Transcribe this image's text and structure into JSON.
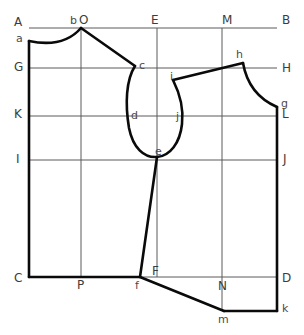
{
  "diagram": {
    "type": "sewing-pattern-construction-draft",
    "canvas": {
      "width": 304,
      "height": 335,
      "background": "#ffffff"
    },
    "colors": {
      "outline": "#0a0a0a",
      "construction": "#5a5a5a",
      "label": "#444444",
      "background": "#ffffff"
    },
    "frame": {
      "left": 29,
      "right": 277,
      "top": 28,
      "bottom": 277,
      "corner_labels": [
        "A",
        "B",
        "C",
        "D"
      ]
    },
    "horizontal_guides": [
      {
        "name": "A-B",
        "y": 28,
        "left_label": "A",
        "right_label": "B"
      },
      {
        "name": "G-H",
        "y": 68,
        "left_label": "G",
        "right_label": "H"
      },
      {
        "name": "K-L",
        "y": 116,
        "left_label": "K",
        "right_label": "L"
      },
      {
        "name": "I-J",
        "y": 160,
        "left_label": "I",
        "right_label": "J"
      },
      {
        "name": "C-D",
        "y": 277,
        "left_label": "C",
        "right_label": "D"
      }
    ],
    "vertical_guides": [
      {
        "name": "A-C",
        "x": 29,
        "top_label": "A",
        "bottom_label": "C"
      },
      {
        "name": "O-P",
        "x": 81,
        "top_label": "O",
        "bottom_label": "P"
      },
      {
        "name": "E-F",
        "x": 157,
        "top_label": "E",
        "bottom_label": "F"
      },
      {
        "name": "M-N",
        "x": 222,
        "top_label": "M",
        "bottom_label": "N"
      },
      {
        "name": "B-D",
        "x": 277,
        "top_label": "B",
        "bottom_label": "D"
      }
    ],
    "labels": [
      {
        "text": "A",
        "x": 14,
        "y": 16,
        "class": "major"
      },
      {
        "text": "b",
        "x": 70,
        "y": 15,
        "class": "minor"
      },
      {
        "text": "O",
        "x": 79,
        "y": 14,
        "class": "major"
      },
      {
        "text": "E",
        "x": 151,
        "y": 14,
        "class": "major"
      },
      {
        "text": "M",
        "x": 222,
        "y": 14,
        "class": "major"
      },
      {
        "text": "B",
        "x": 282,
        "y": 14,
        "class": "major"
      },
      {
        "text": "a",
        "x": 16,
        "y": 33,
        "class": "minor"
      },
      {
        "text": "G",
        "x": 14,
        "y": 61,
        "class": "major"
      },
      {
        "text": "c",
        "x": 139,
        "y": 60,
        "class": "minor"
      },
      {
        "text": "h",
        "x": 236,
        "y": 49,
        "class": "minor"
      },
      {
        "text": "H",
        "x": 282,
        "y": 62,
        "class": "major"
      },
      {
        "text": "i",
        "x": 170,
        "y": 71,
        "class": "minor"
      },
      {
        "text": "K",
        "x": 14,
        "y": 108,
        "class": "major"
      },
      {
        "text": "d",
        "x": 131,
        "y": 110,
        "class": "minor"
      },
      {
        "text": "j",
        "x": 176,
        "y": 111,
        "class": "minor"
      },
      {
        "text": "g",
        "x": 281,
        "y": 98,
        "class": "minor"
      },
      {
        "text": "L",
        "x": 282,
        "y": 108,
        "class": "major"
      },
      {
        "text": "I",
        "x": 16,
        "y": 153,
        "class": "major"
      },
      {
        "text": "e",
        "x": 155,
        "y": 146,
        "class": "minor"
      },
      {
        "text": "J",
        "x": 283,
        "y": 153,
        "class": "major"
      },
      {
        "text": "C",
        "x": 14,
        "y": 272,
        "class": "major"
      },
      {
        "text": "P",
        "x": 77,
        "y": 279,
        "class": "major"
      },
      {
        "text": "F",
        "x": 152,
        "y": 265,
        "class": "major"
      },
      {
        "text": "f",
        "x": 135,
        "y": 280,
        "class": "minor"
      },
      {
        "text": "D",
        "x": 282,
        "y": 272,
        "class": "major"
      },
      {
        "text": "N",
        "x": 218,
        "y": 280,
        "class": "major"
      },
      {
        "text": "m",
        "x": 218,
        "y": 314,
        "class": "minor"
      },
      {
        "text": "k",
        "x": 282,
        "y": 303,
        "class": "minor"
      }
    ],
    "key_points": [
      {
        "id": "A",
        "x": 29,
        "y": 28
      },
      {
        "id": "B",
        "x": 277,
        "y": 28
      },
      {
        "id": "C",
        "x": 29,
        "y": 277
      },
      {
        "id": "D",
        "x": 277,
        "y": 277
      },
      {
        "id": "a",
        "x": 29,
        "y": 41
      },
      {
        "id": "b",
        "x": 81,
        "y": 28
      },
      {
        "id": "c",
        "x": 135,
        "y": 66
      },
      {
        "id": "d",
        "x": 135,
        "y": 117
      },
      {
        "id": "e",
        "x": 157,
        "y": 157
      },
      {
        "id": "f",
        "x": 140,
        "y": 277
      },
      {
        "id": "g",
        "x": 277,
        "y": 107
      },
      {
        "id": "h",
        "x": 243,
        "y": 63
      },
      {
        "id": "i",
        "x": 173,
        "y": 80
      },
      {
        "id": "j",
        "x": 181,
        "y": 117
      },
      {
        "id": "k",
        "x": 277,
        "y": 311
      },
      {
        "id": "m",
        "x": 224,
        "y": 311
      }
    ],
    "outline_segments": [
      {
        "name": "front-centre-edge",
        "from": "a",
        "to": "C"
      },
      {
        "name": "front-neckline-curve",
        "from": "a",
        "to": "b"
      },
      {
        "name": "front-shoulder-seam",
        "from": "b",
        "to": "c"
      },
      {
        "name": "front-armhole-curve",
        "from": "c",
        "to": "e"
      },
      {
        "name": "front-side-seam",
        "from": "e",
        "to": "f"
      },
      {
        "name": "front-hem",
        "from": "C",
        "to": "f"
      },
      {
        "name": "back-armhole-curve",
        "from": "e",
        "to": "i"
      },
      {
        "name": "back-shoulder-seam",
        "from": "i",
        "to": "h"
      },
      {
        "name": "back-neckline-curve",
        "from": "h",
        "to": "g"
      },
      {
        "name": "back-centre-edge",
        "from": "g",
        "to": "k"
      },
      {
        "name": "back-hem",
        "from": "f",
        "to": "m"
      },
      {
        "name": "back-hem-lower",
        "from": "m",
        "to": "k"
      }
    ]
  }
}
